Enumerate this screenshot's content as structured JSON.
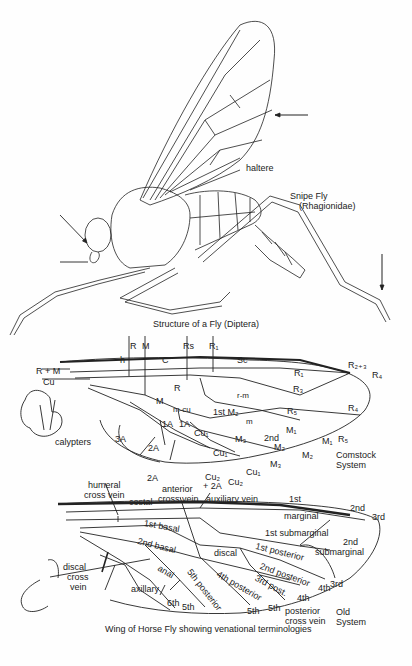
{
  "fly": {
    "caption": "Structure of a Fly (Diptera)",
    "name": "Snipe Fly",
    "family": "(Rhagionidae)",
    "labels": {
      "haltere": "haltere"
    }
  },
  "comstock": {
    "system_label_1": "Comstock",
    "system_label_2": "System",
    "veins": {
      "R": "R",
      "M": "M",
      "Rs": "Rs",
      "R1": "R₁",
      "h": "h",
      "C": "C",
      "Sc": "Sc",
      "RM": "R + M",
      "Cu": "Cu",
      "R23": "R₂₊₃",
      "R4": "R₄",
      "R5": "R₅",
      "m": "m",
      "m_cu": "m-cu",
      "r_m": "r-m",
      "1A_a": "1A",
      "1A_b": "1A",
      "2A": "2A",
      "3A": "3A",
      "2A_b": "2A",
      "Cu1_a": "Cu₁",
      "Cu1_b": "Cu₁",
      "Cu1_c": "Cu₁",
      "Cu2": "Cu₂",
      "Cu2_2A": "Cu₂",
      "plus_2A": "+ 2A",
      "M1_a": "M₁",
      "M1_b": "M₁",
      "M2_a": "M₂",
      "M2_b": "M₂",
      "M3_a": "M₃",
      "M3_b": "M₃",
      "first_M2": "1st M₂",
      "second": "2nd"
    },
    "cells": {
      "R1": "R₁",
      "R3": "R₃",
      "R5": "R₅",
      "R4": "R₄",
      "R": "R",
      "M": "M"
    },
    "calypters": "calypters"
  },
  "old_system": {
    "system_label_1": "Old",
    "system_label_2": "System",
    "caption": "Wing of Horse Fly showing venational terminologies",
    "labels": {
      "humeral": "humeral",
      "humeral2": "cross vein",
      "costal": "costal",
      "anterior": "anterior",
      "anterior2": "cross vein",
      "auxiliary": "auxiliary vein",
      "first": "1st",
      "second": "2nd",
      "third": "3rd",
      "marginal": "marginal",
      "first_submarginal": "1st submarginal",
      "second_submarginal_1": "2nd",
      "second_submarginal_2": "submarginal",
      "first_basal": "1st basal",
      "second_basal": "2nd basal",
      "discal": "discal",
      "first_posterior": "1st posterior",
      "second_posterior": "2nd posterior",
      "third_post": "3rd post.",
      "fourth_posterior": "4th posterior",
      "fifth_posterior": "5th posterior",
      "anal": "anal",
      "axillary": "axillary",
      "sixth": "6th",
      "fifth_a": "5th",
      "fifth_b": "5th",
      "fifth_c": "5th",
      "fourth_a": "4th",
      "fourth_b": "4th",
      "third_b": "3rd",
      "posterior_cv_1": "posterior",
      "posterior_cv_2": "cross vein",
      "discal_cv_1": "discal",
      "discal_cv_2": "cross",
      "discal_cv_3": "vein"
    }
  }
}
